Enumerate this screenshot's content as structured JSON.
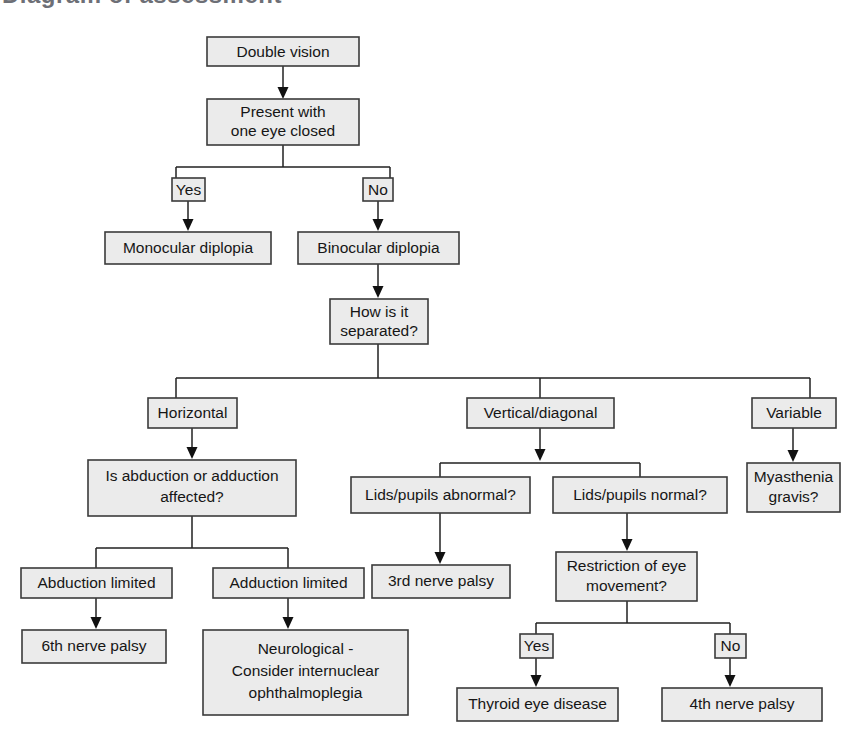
{
  "page": {
    "title": "Diagram of assessment",
    "background_color": "#ffffff",
    "node_fill": "#ebebeb",
    "node_stroke": "#3b3b3b",
    "edge_color": "#222222",
    "text_color": "#161616"
  },
  "diagram": {
    "type": "flowchart",
    "orientation": "top-down",
    "root": "Double vision",
    "nodes": [
      {
        "id": "double-vision",
        "label": "Double vision",
        "lines": [
          "Double vision"
        ]
      },
      {
        "id": "present-one-eye-closed",
        "label": "Present with one eye closed",
        "lines": [
          "Present with",
          "one eye closed"
        ]
      },
      {
        "id": "yes-1",
        "label": "Yes",
        "lines": [
          "Yes"
        ]
      },
      {
        "id": "no-1",
        "label": "No",
        "lines": [
          "No"
        ]
      },
      {
        "id": "monocular-diplopia",
        "label": "Monocular diplopia",
        "lines": [
          "Monocular diplopia"
        ]
      },
      {
        "id": "binocular-diplopia",
        "label": "Binocular diplopia",
        "lines": [
          "Binocular diplopia"
        ]
      },
      {
        "id": "how-separated",
        "label": "How is it separated?",
        "lines": [
          "How is it",
          "separated?"
        ]
      },
      {
        "id": "horizontal",
        "label": "Horizontal",
        "lines": [
          "Horizontal"
        ]
      },
      {
        "id": "vertical-diagonal",
        "label": "Vertical/diagonal",
        "lines": [
          "Vertical/diagonal"
        ]
      },
      {
        "id": "variable",
        "label": "Variable",
        "lines": [
          "Variable"
        ]
      },
      {
        "id": "abduction-adduction",
        "label": "Is abduction or adduction affected?",
        "lines": [
          "Is abduction or adduction",
          "affected?"
        ]
      },
      {
        "id": "lids-abnormal",
        "label": "Lids/pupils abnormal?",
        "lines": [
          "Lids/pupils abnormal?"
        ]
      },
      {
        "id": "lids-normal",
        "label": "Lids/pupils normal?",
        "lines": [
          "Lids/pupils normal?"
        ]
      },
      {
        "id": "myasthenia-gravis",
        "label": "Myasthenia gravis?",
        "lines": [
          "Myasthenia",
          "gravis?"
        ]
      },
      {
        "id": "abduction-limited",
        "label": "Abduction limited",
        "lines": [
          "Abduction limited"
        ]
      },
      {
        "id": "adduction-limited",
        "label": "Adduction limited",
        "lines": [
          "Adduction limited"
        ]
      },
      {
        "id": "third-nerve-palsy",
        "label": "3rd nerve palsy",
        "lines": [
          "3rd nerve palsy"
        ]
      },
      {
        "id": "restriction-eye-movement",
        "label": "Restriction of eye movement?",
        "lines": [
          "Restriction of eye",
          "movement?"
        ]
      },
      {
        "id": "sixth-nerve-palsy",
        "label": "6th nerve palsy",
        "lines": [
          "6th nerve palsy"
        ]
      },
      {
        "id": "neurological-ino",
        "label": "Neurological - Consider internuclear ophthalmoplegia",
        "lines": [
          "Neurological -",
          "Consider internuclear",
          "ophthalmoplegia"
        ]
      },
      {
        "id": "yes-2",
        "label": "Yes",
        "lines": [
          "Yes"
        ]
      },
      {
        "id": "no-2",
        "label": "No",
        "lines": [
          "No"
        ]
      },
      {
        "id": "thyroid-eye-disease",
        "label": "Thyroid eye disease",
        "lines": [
          "Thyroid eye disease"
        ]
      },
      {
        "id": "fourth-nerve-palsy",
        "label": "4th nerve palsy",
        "lines": [
          "4th nerve palsy"
        ]
      }
    ],
    "edges": [
      {
        "from": "double-vision",
        "to": "present-one-eye-closed",
        "label": ""
      },
      {
        "from": "present-one-eye-closed",
        "to": "yes-1",
        "label": "Yes"
      },
      {
        "from": "present-one-eye-closed",
        "to": "no-1",
        "label": "No"
      },
      {
        "from": "yes-1",
        "to": "monocular-diplopia",
        "label": ""
      },
      {
        "from": "no-1",
        "to": "binocular-diplopia",
        "label": ""
      },
      {
        "from": "binocular-diplopia",
        "to": "how-separated",
        "label": ""
      },
      {
        "from": "how-separated",
        "to": "horizontal",
        "label": ""
      },
      {
        "from": "how-separated",
        "to": "vertical-diagonal",
        "label": ""
      },
      {
        "from": "how-separated",
        "to": "variable",
        "label": ""
      },
      {
        "from": "horizontal",
        "to": "abduction-adduction",
        "label": ""
      },
      {
        "from": "vertical-diagonal",
        "to": "lids-abnormal",
        "label": ""
      },
      {
        "from": "vertical-diagonal",
        "to": "lids-normal",
        "label": ""
      },
      {
        "from": "variable",
        "to": "myasthenia-gravis",
        "label": ""
      },
      {
        "from": "abduction-adduction",
        "to": "abduction-limited",
        "label": ""
      },
      {
        "from": "abduction-adduction",
        "to": "adduction-limited",
        "label": ""
      },
      {
        "from": "lids-abnormal",
        "to": "third-nerve-palsy",
        "label": ""
      },
      {
        "from": "lids-normal",
        "to": "restriction-eye-movement",
        "label": ""
      },
      {
        "from": "abduction-limited",
        "to": "sixth-nerve-palsy",
        "label": ""
      },
      {
        "from": "adduction-limited",
        "to": "neurological-ino",
        "label": ""
      },
      {
        "from": "restriction-eye-movement",
        "to": "yes-2",
        "label": "Yes"
      },
      {
        "from": "restriction-eye-movement",
        "to": "no-2",
        "label": "No"
      },
      {
        "from": "yes-2",
        "to": "thyroid-eye-disease",
        "label": ""
      },
      {
        "from": "no-2",
        "to": "fourth-nerve-palsy",
        "label": ""
      }
    ]
  },
  "labels": {
    "double_vision": "Double vision",
    "present_line1": "Present with",
    "present_line2": "one eye closed",
    "yes_1": "Yes",
    "no_1": "No",
    "monocular_diplopia": "Monocular diplopia",
    "binocular_diplopia": "Binocular diplopia",
    "how_line1": "How is it",
    "how_line2": "separated?",
    "horizontal": "Horizontal",
    "vertical_diagonal": "Vertical/diagonal",
    "variable": "Variable",
    "abd_add_line1": "Is abduction or adduction",
    "abd_add_line2": "affected?",
    "lids_abnormal": "Lids/pupils abnormal?",
    "lids_normal": "Lids/pupils normal?",
    "myasthenia_line1": "Myasthenia",
    "myasthenia_line2": "gravis?",
    "abduction_limited": "Abduction limited",
    "adduction_limited": "Adduction limited",
    "third_nerve_palsy": "3rd nerve palsy",
    "restriction_line1": "Restriction of eye",
    "restriction_line2": "movement?",
    "sixth_nerve_palsy": "6th nerve palsy",
    "neuro_line1": "Neurological -",
    "neuro_line2": "Consider internuclear",
    "neuro_line3": "ophthalmoplegia",
    "yes_2": "Yes",
    "no_2": "No",
    "thyroid_eye_disease": "Thyroid eye disease",
    "fourth_nerve_palsy": "4th nerve palsy"
  }
}
